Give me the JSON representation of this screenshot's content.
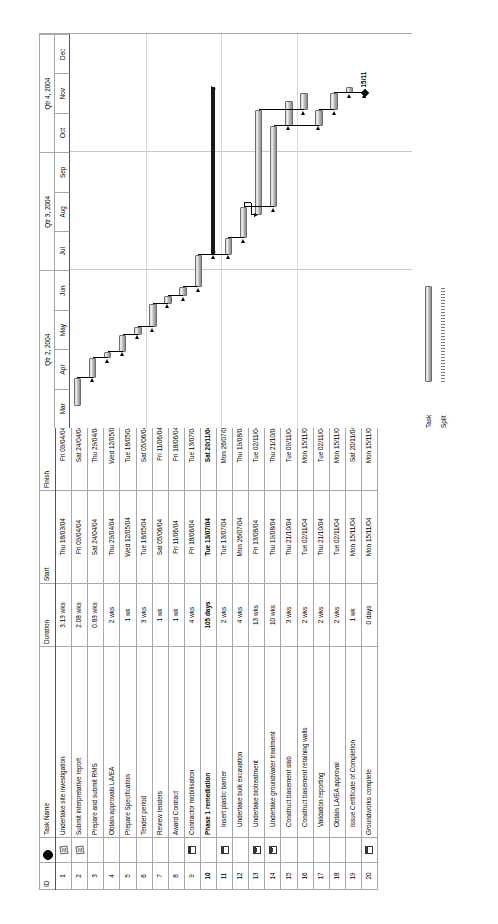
{
  "chart_data": {
    "type": "bar",
    "timescale": {
      "quarters": [
        {
          "label": "Qtr 2, 2004",
          "months": [
            "Mar",
            "Apr",
            "May",
            "Jun"
          ]
        },
        {
          "label": "Qtr 3, 2004",
          "months": [
            "Jul",
            "Aug",
            "Sep"
          ]
        },
        {
          "label": "Qtr 4, 2004",
          "months": [
            "Oct",
            "Nov",
            "Dec"
          ]
        }
      ],
      "start": "2004-03-01",
      "end": "2004-12-31"
    },
    "columns": [
      "ID",
      "Indicator",
      "Task Name",
      "Duration",
      "Start",
      "Finish"
    ],
    "tasks": [
      {
        "id": "1",
        "indicator": "note-icon",
        "name": "Undertake site investigation",
        "duration": "3.13 wks",
        "start": "Thu 18/03/04",
        "finish": "Fri 09/04/04",
        "summary": false,
        "milestone": false,
        "indent": false
      },
      {
        "id": "2",
        "indicator": "note-icon",
        "name": "Submit interpretative report",
        "duration": "2.08 wks",
        "start": "Fri 09/04/04",
        "finish": "Sat 24/04/04",
        "summary": false,
        "milestone": false,
        "indent": false
      },
      {
        "id": "3",
        "indicator": "",
        "name": "Prepare and submit RMS",
        "duration": "0.83 wks",
        "start": "Sat 24/04/04",
        "finish": "Thu 29/04/04",
        "summary": false,
        "milestone": false,
        "indent": false
      },
      {
        "id": "4",
        "indicator": "",
        "name": "Obtain approvals LA/EA",
        "duration": "2 wks",
        "start": "Thu 29/04/04",
        "finish": "Wed 12/05/04",
        "summary": false,
        "milestone": false,
        "indent": false
      },
      {
        "id": "5",
        "indicator": "",
        "name": "Prepare Specification",
        "duration": "1 wk",
        "start": "Wed 12/05/04",
        "finish": "Tue 18/05/04",
        "summary": false,
        "milestone": false,
        "indent": false
      },
      {
        "id": "6",
        "indicator": "",
        "name": "Tender period",
        "duration": "3 wks",
        "start": "Tue 18/05/04",
        "finish": "Sat 05/06/04",
        "summary": false,
        "milestone": false,
        "indent": false
      },
      {
        "id": "7",
        "indicator": "",
        "name": "Review tenders",
        "duration": "1 wk",
        "start": "Sat 05/06/04",
        "finish": "Fri 11/06/04",
        "summary": false,
        "milestone": false,
        "indent": false
      },
      {
        "id": "8",
        "indicator": "",
        "name": "Award Contract",
        "duration": "1 wk",
        "start": "Fri 11/06/04",
        "finish": "Fri 18/06/04",
        "summary": false,
        "milestone": false,
        "indent": false
      },
      {
        "id": "9",
        "indicator": "calendar-icon",
        "name": "Contractor mobilisation",
        "duration": "4 wks",
        "start": "Fri 18/06/04",
        "finish": "Tue 13/07/04",
        "summary": false,
        "milestone": false,
        "indent": false
      },
      {
        "id": "10",
        "indicator": "",
        "name": "Phase 1 remediation",
        "duration": "105 days",
        "start": "Tue 13/07/04",
        "finish": "Sat 20/11/04",
        "summary": true,
        "milestone": false,
        "indent": false
      },
      {
        "id": "11",
        "indicator": "calendar-icon",
        "name": "Insert plastic barrier",
        "duration": "2 wks",
        "start": "Tue 13/07/04",
        "finish": "Mon 26/07/04",
        "summary": false,
        "milestone": false,
        "indent": true
      },
      {
        "id": "12",
        "indicator": "",
        "name": "Undertake bulk excavation",
        "duration": "4 wks",
        "start": "Mon 26/07/04",
        "finish": "Thu 19/08/04",
        "summary": false,
        "milestone": false,
        "indent": true
      },
      {
        "id": "13",
        "indicator": "calendar-icon",
        "name": "Undertake biotreatment",
        "duration": "13 wks",
        "start": "Fri 13/08/04",
        "finish": "Tue 02/11/04",
        "summary": false,
        "milestone": false,
        "indent": true
      },
      {
        "id": "14",
        "indicator": "calendar-icon",
        "name": "Undertake groundwater treatment",
        "duration": "10 wks",
        "start": "Thu 19/08/04",
        "finish": "Thu 21/10/04",
        "summary": false,
        "milestone": false,
        "indent": true
      },
      {
        "id": "15",
        "indicator": "",
        "name": "Construct basement slab",
        "duration": "3 wks",
        "start": "Thu 21/10/04",
        "finish": "Tue 09/11/04",
        "summary": false,
        "milestone": false,
        "indent": true
      },
      {
        "id": "16",
        "indicator": "",
        "name": "Construct basement retaining walls",
        "duration": "2 wks",
        "start": "Tue 02/11/04",
        "finish": "Mon 15/11/04",
        "summary": false,
        "milestone": false,
        "indent": true
      },
      {
        "id": "17",
        "indicator": "",
        "name": "Validation reporting",
        "duration": "2 wks",
        "start": "Thu 21/10/04",
        "finish": "Tue 02/11/04",
        "summary": false,
        "milestone": false,
        "indent": true
      },
      {
        "id": "18",
        "indicator": "",
        "name": "Obtain LA/EA approval",
        "duration": "2 wks",
        "start": "Tue 02/11/04",
        "finish": "Mon 15/11/04",
        "summary": false,
        "milestone": false,
        "indent": true
      },
      {
        "id": "19",
        "indicator": "",
        "name": "Issue Certificate of Completion",
        "duration": "1 wk",
        "start": "Mon 15/11/04",
        "finish": "Sat 20/11/04",
        "summary": false,
        "milestone": false,
        "indent": true
      },
      {
        "id": "20",
        "indicator": "calendar-clock-icon",
        "name": "Groundworks complete",
        "duration": "0 days",
        "start": "Mon 15/11/04",
        "finish": "Mon 15/11/04",
        "summary": false,
        "milestone": true,
        "indent": false
      }
    ],
    "milestone_labels": [
      {
        "task_id": "20",
        "label": "15/11"
      }
    ],
    "legend": [
      {
        "label": "Task",
        "style": "task-bar"
      },
      {
        "label": "Split",
        "style": "split-line"
      }
    ],
    "colors": {
      "bar_fill": "#c8c8c8",
      "bar_border": "#6d6d6d",
      "summary_bar": "#1a1a1a",
      "grid_line": "#c9c9c9",
      "table_border": "#a8a8a8",
      "milestone": "#000000"
    }
  },
  "table": {
    "headers": {
      "id": "ID",
      "indicator": "",
      "name": "Task Name",
      "duration": "Duration",
      "start": "Start",
      "finish": "Finish"
    }
  },
  "legend": {
    "task_label": "Task",
    "split_label": "Split"
  }
}
